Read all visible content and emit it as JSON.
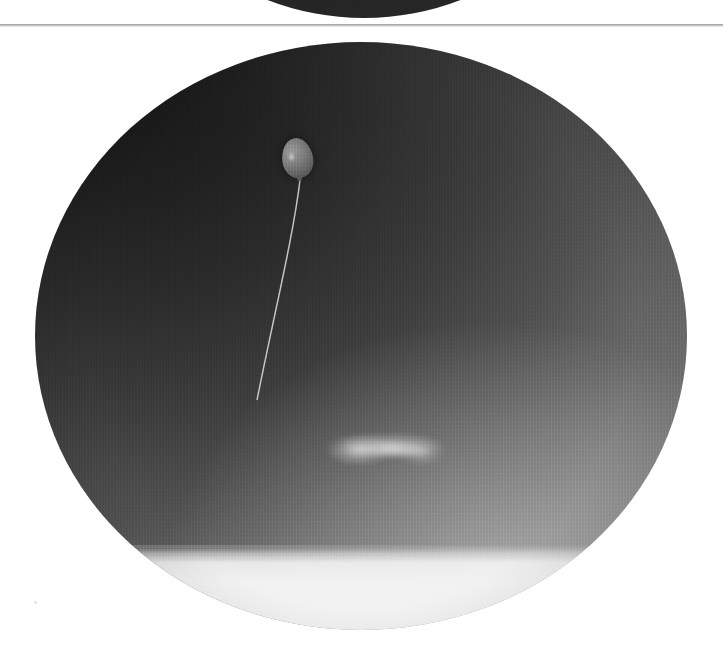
{
  "viewer": {
    "title": "All-Sky Camera Image Viewer",
    "frame_separator_label": "frame divider"
  },
  "frames": [
    {
      "id": "previous-frame",
      "label": "Previous all-sky frame (partially visible)",
      "shape": "circle",
      "sky_tone": "#1f1f1f"
    },
    {
      "id": "current-frame",
      "label": "All-sky fisheye image of overcast sky with tethered balloon",
      "shape": "circle",
      "sky_tone_zenith": "#171717",
      "sky_tone_horizon": "#9a9a9a",
      "ground_band_tone": "#f2f2f2"
    }
  ],
  "objects": [
    {
      "id": "balloon",
      "label": "Tethered weather balloon",
      "center_x": 262,
      "center_y": 116,
      "width": 31,
      "height": 40,
      "tone": "#747474"
    },
    {
      "id": "tether-string",
      "label": "Balloon tether string",
      "start_x": 265,
      "start_y": 138,
      "end_x": 222,
      "end_y": 358,
      "tone": "#b9b9b9"
    },
    {
      "id": "cloud-wisp",
      "label": "Faint bright cloud wisp",
      "center_x": 350,
      "center_y": 407,
      "width": 120,
      "height": 34,
      "tone": "#ededed"
    },
    {
      "id": "horizon-band",
      "label": "Bright ground / horizon band",
      "y": 546,
      "tone": "#f2f2f2"
    }
  ],
  "background": {
    "page_tone": "#ffffff",
    "divider_tone": "#a3a3a3"
  }
}
